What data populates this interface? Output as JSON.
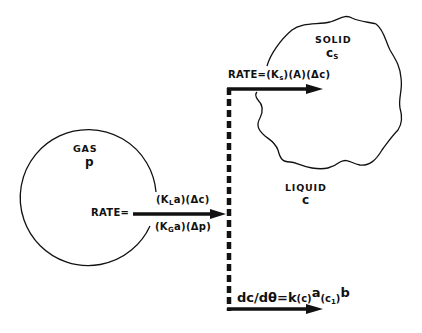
{
  "diagram": {
    "type": "mass-transfer schematic",
    "colors": {
      "ink": "#111111",
      "background": "#ffffff"
    },
    "regions": {
      "gas": {
        "title": "GAS",
        "symbol": "p",
        "shape": "circle"
      },
      "liquid": {
        "title": "LIQUID",
        "symbol": "c"
      },
      "solid": {
        "title": "SOLID",
        "symbol": "c",
        "symbol_sub": "S",
        "shape": "irregular-blob"
      }
    },
    "gas_liquid_rate": {
      "prefix": "RATE=",
      "upper": {
        "p1": "(K",
        "sub": "L",
        "p2": "a)(Δc)"
      },
      "lower": {
        "p1": "(K",
        "sub": "G",
        "p2": "a)(Δp)"
      }
    },
    "liquid_solid_rate": {
      "prefix": "RATE=(K",
      "sub": "s",
      "rest": ")(A)(Δc)"
    },
    "reaction_rate": {
      "lhs": "dc/dθ",
      "eq": "=",
      "k": "k",
      "c_term": "(c)",
      "exp_a": "a",
      "c1_open": "(c",
      "c1_sub": "1",
      "c1_close": ")",
      "exp_b": "b"
    }
  }
}
